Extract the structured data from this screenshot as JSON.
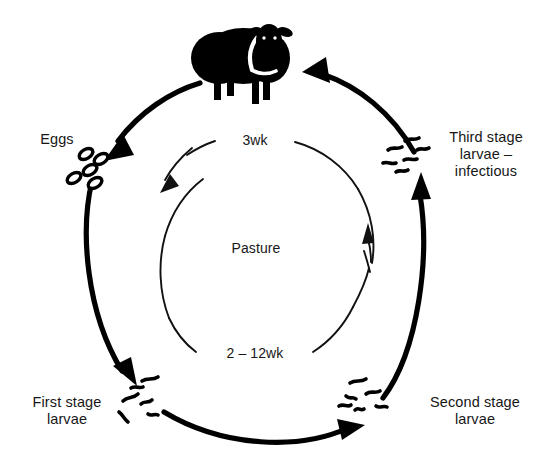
{
  "diagram": {
    "type": "cycle-diagram",
    "background_color": "#ffffff",
    "ink_color": "#000000",
    "text_color": "#171717",
    "center_label": "Pasture",
    "nodes": [
      {
        "id": "host",
        "label": "",
        "icon": "sheep-icon",
        "position": "top",
        "description": "Black sheep silhouette (definitive host)"
      },
      {
        "id": "eggs",
        "label": "Eggs",
        "icon": "eggs-icon",
        "position": "upper-left",
        "count": 5
      },
      {
        "id": "first-stage-larvae",
        "label": "First stage\nlarvae",
        "icon": "larvae-icon",
        "position": "lower-left",
        "count": 5
      },
      {
        "id": "second-stage-larvae",
        "label": "Second stage\nlarvae",
        "icon": "larvae-icon",
        "position": "lower-right",
        "count": 6
      },
      {
        "id": "third-stage-larvae",
        "label": "Third stage\nlarvae –\ninfectious",
        "icon": "larvae-icon",
        "position": "upper-right",
        "count": 5
      }
    ],
    "outer_arrows": [
      {
        "id": "host-to-eggs",
        "from": "host",
        "to": "eggs",
        "direction": "counter-clockwise",
        "style": "thick-tapered"
      },
      {
        "id": "eggs-to-l1",
        "from": "eggs",
        "to": "first-stage-larvae",
        "direction": "counter-clockwise",
        "style": "thick-tapered"
      },
      {
        "id": "l1-to-l2",
        "from": "first-stage-larvae",
        "to": "second-stage-larvae",
        "direction": "counter-clockwise",
        "style": "thick-tapered"
      },
      {
        "id": "l2-to-l3",
        "from": "second-stage-larvae",
        "to": "third-stage-larvae",
        "direction": "counter-clockwise",
        "style": "thick-tapered"
      },
      {
        "id": "l3-to-host",
        "from": "third-stage-larvae",
        "to": "host",
        "direction": "counter-clockwise",
        "style": "thick-tapered"
      }
    ],
    "inner_arcs": [
      {
        "id": "inner-arc-top",
        "label": "3wk",
        "position": "top",
        "arrow_direction": "down-left"
      },
      {
        "id": "inner-arc-bottom",
        "label": "2 – 12wk",
        "position": "bottom",
        "arrow_direction": "up"
      }
    ],
    "timings": [
      {
        "label": "3wk",
        "meaning": "prepatent period in host"
      },
      {
        "label": "2 – 12wk",
        "meaning": "development on pasture"
      }
    ]
  }
}
